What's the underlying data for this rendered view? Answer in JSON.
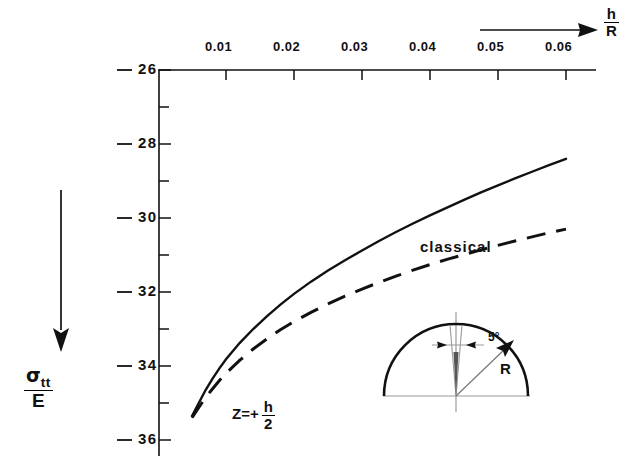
{
  "chart_data": {
    "type": "line",
    "title": "",
    "xlabel": "h/R",
    "ylabel": "sigma_tt / E",
    "xlim": [
      0.0,
      0.0625
    ],
    "ylim": [
      36,
      26
    ],
    "y_axis_inverted": true,
    "grid": false,
    "x_ticks": [
      0.01,
      0.02,
      0.03,
      0.04,
      0.05,
      0.06
    ],
    "x_tick_labels": [
      "0.01",
      "0.02",
      "0.03",
      "0.04",
      "0.05",
      "0.06"
    ],
    "y_ticks": [
      26,
      28,
      30,
      32,
      34,
      36
    ],
    "y_tick_labels": [
      "26",
      "28",
      "30",
      "32",
      "34",
      "36"
    ],
    "y_minor_ticks": [
      27,
      29,
      31,
      33,
      35
    ],
    "axis_position": {
      "x_axis": "top",
      "y_axis": "left"
    },
    "series": [
      {
        "name": "improved",
        "style": "solid",
        "label": "",
        "x": [
          0.005,
          0.006,
          0.007,
          0.008,
          0.009,
          0.01,
          0.012,
          0.014,
          0.016,
          0.018,
          0.02,
          0.0225,
          0.025,
          0.0275,
          0.03,
          0.0325,
          0.035,
          0.0375,
          0.04,
          0.0425,
          0.045,
          0.0475,
          0.05,
          0.0525,
          0.055,
          0.0575,
          0.06
        ],
        "values": [
          35.35,
          35.0,
          34.65,
          34.35,
          34.07,
          33.82,
          33.38,
          33.0,
          32.66,
          32.34,
          32.05,
          31.72,
          31.42,
          31.14,
          30.88,
          30.62,
          30.38,
          30.15,
          29.93,
          29.72,
          29.51,
          29.31,
          29.12,
          28.93,
          28.75,
          28.57,
          28.4
        ]
      },
      {
        "name": "classical",
        "style": "dashed",
        "label": "classical",
        "x": [
          0.005,
          0.006,
          0.007,
          0.008,
          0.009,
          0.01,
          0.012,
          0.014,
          0.016,
          0.018,
          0.02,
          0.0225,
          0.025,
          0.0275,
          0.03,
          0.0325,
          0.035,
          0.0375,
          0.04,
          0.0425,
          0.045,
          0.0475,
          0.05,
          0.0525,
          0.055,
          0.0575,
          0.06
        ],
        "values": [
          35.4,
          35.12,
          34.85,
          34.62,
          34.4,
          34.2,
          33.85,
          33.54,
          33.27,
          33.02,
          32.8,
          32.55,
          32.32,
          32.11,
          31.92,
          31.74,
          31.57,
          31.41,
          31.26,
          31.12,
          30.99,
          30.86,
          30.74,
          30.62,
          30.51,
          30.4,
          30.3
        ]
      }
    ],
    "annotations": {
      "z_condition": "Z = + h/2",
      "z_symbol": "Z",
      "z_equals": "=+",
      "z_num": "h",
      "z_den": "2",
      "x_axis_num": "h",
      "x_axis_den": "R",
      "y_axis_num": "σ",
      "y_axis_sub": "tt",
      "y_axis_den": "E",
      "arrow_direction_x": "right",
      "arrow_direction_y": "down"
    },
    "inset": {
      "name": "hemispherical-shell-diagram",
      "angle_label": "5°",
      "radius_label": "R",
      "shape": "hemisphere"
    }
  },
  "colors": {
    "ink": "#111111",
    "background": "#ffffff",
    "inset_light": "#9a9a9a"
  }
}
